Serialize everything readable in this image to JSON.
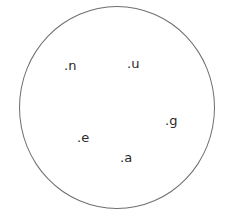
{
  "diagram": {
    "shape": "circle",
    "stroke_color": "#6e6e6e",
    "labels": [
      {
        "text": ".n",
        "x": 64,
        "y": 59
      },
      {
        "text": ".u",
        "x": 127,
        "y": 57
      },
      {
        "text": ".g",
        "x": 165,
        "y": 114
      },
      {
        "text": ".e",
        "x": 77,
        "y": 131
      },
      {
        "text": ".a",
        "x": 120,
        "y": 151
      }
    ]
  }
}
